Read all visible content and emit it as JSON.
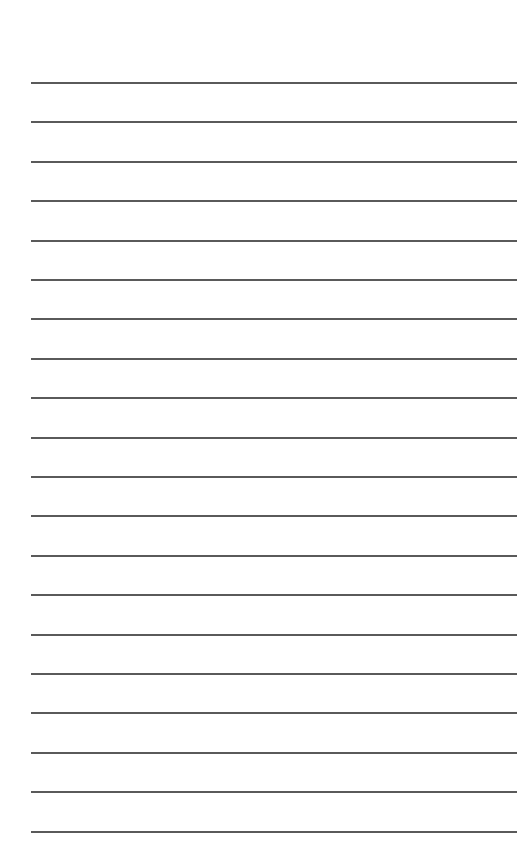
{
  "page": {
    "type": "lined-paper",
    "background_color": "#ffffff",
    "line_color": "#5a5a5a",
    "line_count": 20,
    "line_left_px": 31,
    "line_right_px": 517,
    "first_line_y_px": 82,
    "line_spacing_px": 39.4,
    "line_thickness_px": 1.5
  }
}
